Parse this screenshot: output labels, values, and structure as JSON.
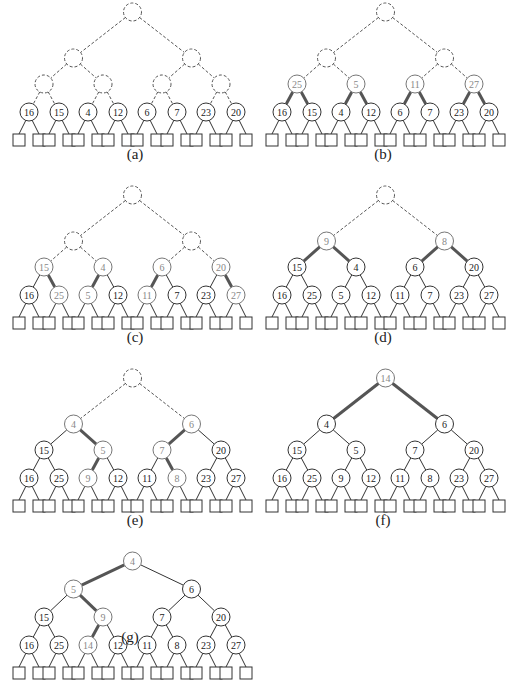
{
  "figure": {
    "colors": {
      "line": "#333333",
      "dashed": "#555555",
      "highlight_edge": "#555555",
      "new_node_text": "#888888",
      "node_text": "#222222"
    },
    "panels": [
      {
        "label": "(a)",
        "nodes": [
          {
            "level": 0,
            "idx": 0,
            "key": "",
            "state": "dashed"
          },
          {
            "level": 1,
            "idx": 0,
            "key": "",
            "state": "dashed"
          },
          {
            "level": 1,
            "idx": 1,
            "key": "",
            "state": "dashed"
          },
          {
            "level": 2,
            "idx": 0,
            "key": "",
            "state": "dashed"
          },
          {
            "level": 2,
            "idx": 1,
            "key": "",
            "state": "dashed"
          },
          {
            "level": 2,
            "idx": 2,
            "key": "",
            "state": "dashed"
          },
          {
            "level": 2,
            "idx": 3,
            "key": "",
            "state": "dashed"
          },
          {
            "level": 3,
            "idx": 0,
            "key": "16",
            "state": "normal"
          },
          {
            "level": 3,
            "idx": 1,
            "key": "15",
            "state": "normal"
          },
          {
            "level": 3,
            "idx": 2,
            "key": "4",
            "state": "normal"
          },
          {
            "level": 3,
            "idx": 3,
            "key": "12",
            "state": "normal"
          },
          {
            "level": 3,
            "idx": 4,
            "key": "6",
            "state": "normal"
          },
          {
            "level": 3,
            "idx": 5,
            "key": "7",
            "state": "normal"
          },
          {
            "level": 3,
            "idx": 6,
            "key": "23",
            "state": "normal"
          },
          {
            "level": 3,
            "idx": 7,
            "key": "20",
            "state": "normal"
          }
        ],
        "thick_edges": []
      },
      {
        "label": "(b)",
        "nodes": [
          {
            "level": 0,
            "idx": 0,
            "key": "",
            "state": "dashed"
          },
          {
            "level": 1,
            "idx": 0,
            "key": "",
            "state": "dashed"
          },
          {
            "level": 1,
            "idx": 1,
            "key": "",
            "state": "dashed"
          },
          {
            "level": 2,
            "idx": 0,
            "key": "25",
            "state": "new"
          },
          {
            "level": 2,
            "idx": 1,
            "key": "5",
            "state": "new"
          },
          {
            "level": 2,
            "idx": 2,
            "key": "11",
            "state": "new"
          },
          {
            "level": 2,
            "idx": 3,
            "key": "27",
            "state": "new"
          },
          {
            "level": 3,
            "idx": 0,
            "key": "16",
            "state": "normal"
          },
          {
            "level": 3,
            "idx": 1,
            "key": "15",
            "state": "normal"
          },
          {
            "level": 3,
            "idx": 2,
            "key": "4",
            "state": "normal"
          },
          {
            "level": 3,
            "idx": 3,
            "key": "12",
            "state": "normal"
          },
          {
            "level": 3,
            "idx": 4,
            "key": "6",
            "state": "normal"
          },
          {
            "level": 3,
            "idx": 5,
            "key": "7",
            "state": "normal"
          },
          {
            "level": 3,
            "idx": 6,
            "key": "23",
            "state": "normal"
          },
          {
            "level": 3,
            "idx": 7,
            "key": "20",
            "state": "normal"
          }
        ],
        "thick_edges": [
          [
            2,
            0,
            3,
            0
          ],
          [
            2,
            0,
            3,
            1
          ],
          [
            2,
            1,
            3,
            2
          ],
          [
            2,
            1,
            3,
            3
          ],
          [
            2,
            2,
            3,
            4
          ],
          [
            2,
            2,
            3,
            5
          ],
          [
            2,
            3,
            3,
            6
          ],
          [
            2,
            3,
            3,
            7
          ]
        ]
      },
      {
        "label": "(c)",
        "nodes": [
          {
            "level": 0,
            "idx": 0,
            "key": "",
            "state": "dashed"
          },
          {
            "level": 1,
            "idx": 0,
            "key": "",
            "state": "dashed"
          },
          {
            "level": 1,
            "idx": 1,
            "key": "",
            "state": "dashed"
          },
          {
            "level": 2,
            "idx": 0,
            "key": "15",
            "state": "new"
          },
          {
            "level": 2,
            "idx": 1,
            "key": "4",
            "state": "new"
          },
          {
            "level": 2,
            "idx": 2,
            "key": "6",
            "state": "new"
          },
          {
            "level": 2,
            "idx": 3,
            "key": "20",
            "state": "new"
          },
          {
            "level": 3,
            "idx": 0,
            "key": "16",
            "state": "normal"
          },
          {
            "level": 3,
            "idx": 1,
            "key": "25",
            "state": "new"
          },
          {
            "level": 3,
            "idx": 2,
            "key": "5",
            "state": "new"
          },
          {
            "level": 3,
            "idx": 3,
            "key": "12",
            "state": "normal"
          },
          {
            "level": 3,
            "idx": 4,
            "key": "11",
            "state": "new"
          },
          {
            "level": 3,
            "idx": 5,
            "key": "7",
            "state": "normal"
          },
          {
            "level": 3,
            "idx": 6,
            "key": "23",
            "state": "normal"
          },
          {
            "level": 3,
            "idx": 7,
            "key": "27",
            "state": "new"
          }
        ],
        "thick_edges": [
          [
            2,
            0,
            3,
            1
          ],
          [
            2,
            1,
            3,
            2
          ],
          [
            2,
            2,
            3,
            4
          ],
          [
            2,
            3,
            3,
            7
          ]
        ]
      },
      {
        "label": "(d)",
        "nodes": [
          {
            "level": 0,
            "idx": 0,
            "key": "",
            "state": "dashed"
          },
          {
            "level": 1,
            "idx": 0,
            "key": "9",
            "state": "new"
          },
          {
            "level": 1,
            "idx": 1,
            "key": "8",
            "state": "new"
          },
          {
            "level": 2,
            "idx": 0,
            "key": "15",
            "state": "normal"
          },
          {
            "level": 2,
            "idx": 1,
            "key": "4",
            "state": "normal"
          },
          {
            "level": 2,
            "idx": 2,
            "key": "6",
            "state": "normal"
          },
          {
            "level": 2,
            "idx": 3,
            "key": "20",
            "state": "normal"
          },
          {
            "level": 3,
            "idx": 0,
            "key": "16",
            "state": "normal"
          },
          {
            "level": 3,
            "idx": 1,
            "key": "25",
            "state": "normal"
          },
          {
            "level": 3,
            "idx": 2,
            "key": "5",
            "state": "normal"
          },
          {
            "level": 3,
            "idx": 3,
            "key": "12",
            "state": "normal"
          },
          {
            "level": 3,
            "idx": 4,
            "key": "11",
            "state": "normal"
          },
          {
            "level": 3,
            "idx": 5,
            "key": "7",
            "state": "normal"
          },
          {
            "level": 3,
            "idx": 6,
            "key": "23",
            "state": "normal"
          },
          {
            "level": 3,
            "idx": 7,
            "key": "27",
            "state": "normal"
          }
        ],
        "thick_edges": [
          [
            1,
            0,
            2,
            0
          ],
          [
            1,
            0,
            2,
            1
          ],
          [
            1,
            1,
            2,
            2
          ],
          [
            1,
            1,
            2,
            3
          ]
        ]
      },
      {
        "label": "(e)",
        "nodes": [
          {
            "level": 0,
            "idx": 0,
            "key": "",
            "state": "dashed"
          },
          {
            "level": 1,
            "idx": 0,
            "key": "4",
            "state": "new"
          },
          {
            "level": 1,
            "idx": 1,
            "key": "6",
            "state": "new"
          },
          {
            "level": 2,
            "idx": 0,
            "key": "15",
            "state": "normal"
          },
          {
            "level": 2,
            "idx": 1,
            "key": "5",
            "state": "new"
          },
          {
            "level": 2,
            "idx": 2,
            "key": "7",
            "state": "new"
          },
          {
            "level": 2,
            "idx": 3,
            "key": "20",
            "state": "normal"
          },
          {
            "level": 3,
            "idx": 0,
            "key": "16",
            "state": "normal"
          },
          {
            "level": 3,
            "idx": 1,
            "key": "25",
            "state": "normal"
          },
          {
            "level": 3,
            "idx": 2,
            "key": "9",
            "state": "new"
          },
          {
            "level": 3,
            "idx": 3,
            "key": "12",
            "state": "normal"
          },
          {
            "level": 3,
            "idx": 4,
            "key": "11",
            "state": "normal"
          },
          {
            "level": 3,
            "idx": 5,
            "key": "8",
            "state": "new"
          },
          {
            "level": 3,
            "idx": 6,
            "key": "23",
            "state": "normal"
          },
          {
            "level": 3,
            "idx": 7,
            "key": "27",
            "state": "normal"
          }
        ],
        "thick_edges": [
          [
            1,
            0,
            2,
            1
          ],
          [
            2,
            1,
            3,
            2
          ],
          [
            1,
            1,
            2,
            2
          ],
          [
            2,
            2,
            3,
            5
          ]
        ]
      },
      {
        "label": "(f)",
        "nodes": [
          {
            "level": 0,
            "idx": 0,
            "key": "14",
            "state": "new"
          },
          {
            "level": 1,
            "idx": 0,
            "key": "4",
            "state": "normal"
          },
          {
            "level": 1,
            "idx": 1,
            "key": "6",
            "state": "normal"
          },
          {
            "level": 2,
            "idx": 0,
            "key": "15",
            "state": "normal"
          },
          {
            "level": 2,
            "idx": 1,
            "key": "5",
            "state": "normal"
          },
          {
            "level": 2,
            "idx": 2,
            "key": "7",
            "state": "normal"
          },
          {
            "level": 2,
            "idx": 3,
            "key": "20",
            "state": "normal"
          },
          {
            "level": 3,
            "idx": 0,
            "key": "16",
            "state": "normal"
          },
          {
            "level": 3,
            "idx": 1,
            "key": "25",
            "state": "normal"
          },
          {
            "level": 3,
            "idx": 2,
            "key": "9",
            "state": "normal"
          },
          {
            "level": 3,
            "idx": 3,
            "key": "12",
            "state": "normal"
          },
          {
            "level": 3,
            "idx": 4,
            "key": "11",
            "state": "normal"
          },
          {
            "level": 3,
            "idx": 5,
            "key": "8",
            "state": "normal"
          },
          {
            "level": 3,
            "idx": 6,
            "key": "23",
            "state": "normal"
          },
          {
            "level": 3,
            "idx": 7,
            "key": "27",
            "state": "normal"
          }
        ],
        "thick_edges": [
          [
            0,
            0,
            1,
            0
          ],
          [
            0,
            0,
            1,
            1
          ]
        ]
      },
      {
        "label": "(g)",
        "nodes": [
          {
            "level": 0,
            "idx": 0,
            "key": "4",
            "state": "new"
          },
          {
            "level": 1,
            "idx": 0,
            "key": "5",
            "state": "new"
          },
          {
            "level": 1,
            "idx": 1,
            "key": "6",
            "state": "normal"
          },
          {
            "level": 2,
            "idx": 0,
            "key": "15",
            "state": "normal"
          },
          {
            "level": 2,
            "idx": 1,
            "key": "9",
            "state": "new"
          },
          {
            "level": 2,
            "idx": 2,
            "key": "7",
            "state": "normal"
          },
          {
            "level": 2,
            "idx": 3,
            "key": "20",
            "state": "normal"
          },
          {
            "level": 3,
            "idx": 0,
            "key": "16",
            "state": "normal"
          },
          {
            "level": 3,
            "idx": 1,
            "key": "25",
            "state": "normal"
          },
          {
            "level": 3,
            "idx": 2,
            "key": "14",
            "state": "new"
          },
          {
            "level": 3,
            "idx": 3,
            "key": "12",
            "state": "normal"
          },
          {
            "level": 3,
            "idx": 4,
            "key": "11",
            "state": "normal"
          },
          {
            "level": 3,
            "idx": 5,
            "key": "8",
            "state": "normal"
          },
          {
            "level": 3,
            "idx": 6,
            "key": "23",
            "state": "normal"
          },
          {
            "level": 3,
            "idx": 7,
            "key": "27",
            "state": "normal"
          }
        ],
        "thick_edges": [
          [
            0,
            0,
            1,
            0
          ],
          [
            1,
            0,
            2,
            1
          ],
          [
            2,
            1,
            3,
            2
          ]
        ]
      }
    ]
  }
}
